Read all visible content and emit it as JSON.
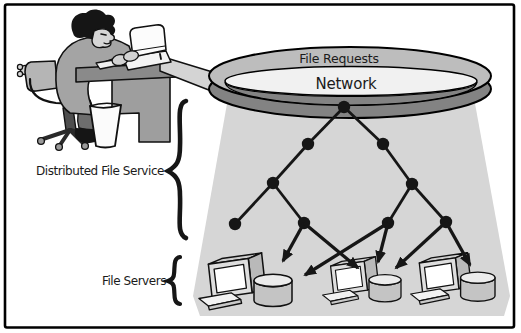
{
  "labels": {
    "file_requests": "File Requests",
    "network": "Network",
    "distributed_file_service": "Distributed File Service",
    "file_servers": "File Servers"
  },
  "colors": {
    "ink": "#1b1b1b",
    "ring_top_band": "#bdbdbd",
    "ring_front_band": "#838383",
    "ring_inner": "#f1f1f1",
    "cone": "#d6d6d6",
    "desk": "#8f8f8f",
    "background": "#ffffff"
  },
  "diagram": {
    "tree": {
      "nodes": [
        {
          "id": "root",
          "x": 344,
          "y": 107
        },
        {
          "id": "n-l1",
          "x": 308,
          "y": 144
        },
        {
          "id": "n-r1",
          "x": 383,
          "y": 144
        },
        {
          "id": "n-l2",
          "x": 273,
          "y": 183
        },
        {
          "id": "n-r2",
          "x": 412,
          "y": 184
        },
        {
          "id": "leaf-a",
          "x": 235,
          "y": 224
        },
        {
          "id": "leaf-b",
          "x": 304,
          "y": 223
        },
        {
          "id": "leaf-c",
          "x": 388,
          "y": 223
        },
        {
          "id": "leaf-d",
          "x": 446,
          "y": 222
        }
      ],
      "edges": [
        [
          "root",
          "n-l1"
        ],
        [
          "root",
          "n-r1"
        ],
        [
          "n-l1",
          "n-l2"
        ],
        [
          "n-r1",
          "n-r2"
        ],
        [
          "n-l2",
          "leaf-a"
        ],
        [
          "n-l2",
          "leaf-b"
        ],
        [
          "n-r2",
          "leaf-c"
        ],
        [
          "n-r2",
          "leaf-d"
        ]
      ],
      "arrows": [
        {
          "from": "leaf-b",
          "to": [
            283,
            261
          ]
        },
        {
          "from": "leaf-b",
          "to": [
            358,
            268
          ]
        },
        {
          "from": "leaf-c",
          "to": [
            305,
            275
          ]
        },
        {
          "from": "leaf-c",
          "to": [
            378,
            262
          ]
        },
        {
          "from": "leaf-d",
          "to": [
            396,
            268
          ]
        },
        {
          "from": "leaf-d",
          "to": [
            470,
            265
          ]
        }
      ]
    },
    "servers": [
      {
        "id": "file-server-1",
        "x": 197,
        "y": 251,
        "s": 0.95
      },
      {
        "id": "file-server-2",
        "x": 321,
        "y": 255,
        "s": 0.8
      },
      {
        "id": "file-server-3",
        "x": 409,
        "y": 251,
        "s": 0.86
      }
    ]
  }
}
